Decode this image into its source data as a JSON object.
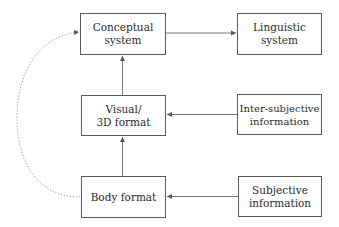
{
  "diagram": {
    "nodes": {
      "conceptual": {
        "line1": "Conceptual",
        "line2": "system"
      },
      "linguistic": {
        "line1": "Linguistic",
        "line2": "system"
      },
      "visual": {
        "line1": "Visual/",
        "line2": "3D format"
      },
      "inter_subjective": {
        "line1": "Inter-subjective",
        "line2": "information"
      },
      "body": {
        "line1": "Body format"
      },
      "subjective": {
        "line1": "Subjective",
        "line2": "information"
      }
    },
    "edges": [
      {
        "from": "conceptual",
        "to": "linguistic",
        "style": "solid"
      },
      {
        "from": "visual",
        "to": "conceptual",
        "style": "solid"
      },
      {
        "from": "body",
        "to": "visual",
        "style": "solid"
      },
      {
        "from": "inter_subjective",
        "to": "visual",
        "style": "solid"
      },
      {
        "from": "subjective",
        "to": "body",
        "style": "solid"
      },
      {
        "from": "body",
        "to": "conceptual",
        "style": "dotted"
      }
    ],
    "colors": {
      "line": "#6a6a6a",
      "dotted": "#8a8a8a",
      "border": "#5a5a5a",
      "text": "#2a2a2a"
    }
  }
}
